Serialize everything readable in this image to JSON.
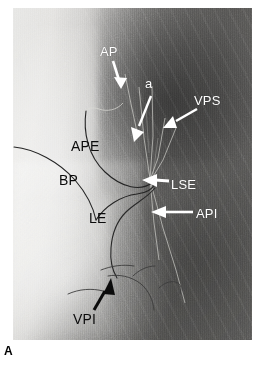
{
  "figure": {
    "panel_letter": "A",
    "modality": "chest-radiograph"
  },
  "labels": [
    {
      "id": "ap",
      "text": "AP",
      "meaning": "anterior segmental pulmonary artery",
      "color": "#ffffff",
      "style": "white",
      "font_size": 13,
      "x": 100,
      "y": 45,
      "arrow": {
        "type": "white",
        "from_x": 113,
        "from_y": 61,
        "to_x": 121,
        "to_y": 87
      }
    },
    {
      "id": "a",
      "text": "a",
      "meaning": "small artery branch",
      "color": "#ffffff",
      "style": "white",
      "font_size": 13,
      "x": 145,
      "y": 77,
      "arrow": {
        "type": "white",
        "from_x": 150,
        "from_y": 93,
        "to_x": 134,
        "to_y": 142
      }
    },
    {
      "id": "vps",
      "text": "VPS",
      "meaning": "superior pulmonary vein",
      "color": "#ffffff",
      "style": "white",
      "font_size": 13,
      "x": 194,
      "y": 94,
      "arrow": {
        "type": "white",
        "from_x": 195,
        "from_y": 107,
        "to_x": 163,
        "to_y": 128
      }
    },
    {
      "id": "lse",
      "text": "LSE",
      "meaning": "superior extrapulmonary line",
      "color": "#ffffff",
      "style": "white",
      "font_size": 13,
      "x": 171,
      "y": 178,
      "arrow": {
        "type": "white",
        "from_x": 168,
        "from_y": 182,
        "to_x": 146,
        "to_y": 180
      }
    },
    {
      "id": "api",
      "text": "API",
      "meaning": "inferior segmental pulmonary artery",
      "color": "#ffffff",
      "style": "white",
      "font_size": 13,
      "x": 196,
      "y": 207,
      "arrow": {
        "type": "white",
        "from_x": 192,
        "from_y": 212,
        "to_x": 152,
        "to_y": 212
      }
    },
    {
      "id": "ape",
      "text": "APE",
      "meaning": "external pulmonary artery",
      "color": "#0b0b0b",
      "style": "black",
      "font_size": 14,
      "x": 71,
      "y": 139,
      "arrow": null
    },
    {
      "id": "bp",
      "text": "BP",
      "meaning": "principal bronchus",
      "color": "#0b0b0b",
      "style": "black",
      "font_size": 14,
      "x": 59,
      "y": 173,
      "arrow": null
    },
    {
      "id": "le",
      "text": "LE",
      "meaning": "external line",
      "color": "#0b0b0b",
      "style": "black",
      "font_size": 14,
      "x": 89,
      "y": 211,
      "arrow": null
    },
    {
      "id": "vpi",
      "text": "VPI",
      "meaning": "inferior pulmonary vein",
      "color": "#0b0b0b",
      "style": "black",
      "font_size": 14,
      "x": 73,
      "y": 312,
      "arrow": {
        "type": "black",
        "from_x": 94,
        "from_y": 308,
        "to_x": 110,
        "to_y": 280
      }
    }
  ],
  "annotation_curves": [
    {
      "id": "curve-upper",
      "meaning": "drawn outline of the pulmonary artery / bronchus border",
      "color": "#2b2b2b"
    },
    {
      "id": "curve-lower",
      "meaning": "drawn outline of the bronchial tree border",
      "color": "#2b2b2b"
    },
    {
      "id": "fissure-lines",
      "meaning": "thin dark fissure markings near the inferior pulmonary vein",
      "color": "#3a3a3a"
    }
  ],
  "vessel_lines": {
    "meaning": "thin bright opacified vessels radiating from the hilum",
    "color": "#cfcfcb",
    "hilum_x": 150,
    "hilum_y": 179
  },
  "colors": {
    "background": "#ffffff",
    "film_light": "#e6e6e4",
    "film_dark": "#565553",
    "label_white": "#ffffff",
    "label_black": "#0b0b0b",
    "curve": "#2b2b2b"
  }
}
